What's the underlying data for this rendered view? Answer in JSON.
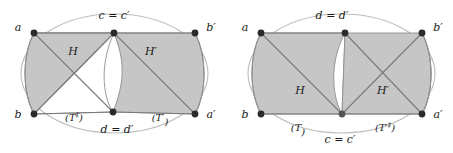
{
  "figure": {
    "type": "diagram",
    "colors": {
      "shade_fill": "#c6c6c6",
      "shade_stroke": "#8a8a8a",
      "ellipse_stroke": "#b9b9b9",
      "edge_stroke": "#7a7a7a",
      "vertex_fill": "#2b2b2b",
      "text": "#1a1a1a",
      "background": "#ffffff"
    },
    "panels": [
      {
        "id": "left",
        "name": "left-diagram",
        "vertices": [
          {
            "id": "a",
            "label": "a",
            "label_pos": "left",
            "x": 34,
            "y": 33
          },
          {
            "id": "b",
            "label": "b",
            "label_pos": "left",
            "x": 34,
            "y": 114
          },
          {
            "id": "c",
            "label": "c = c′",
            "label_pos": "top",
            "x": 114,
            "y": 33
          },
          {
            "id": "d",
            "label": "d = d′",
            "label_pos": "bottom",
            "x": 113,
            "y": 112
          },
          {
            "id": "bp",
            "label": "b′",
            "label_pos": "right",
            "x": 195,
            "y": 33
          },
          {
            "id": "ap",
            "label": "a′",
            "label_pos": "right",
            "x": 195,
            "y": 114
          }
        ],
        "regions": [
          {
            "id": "H",
            "label": "H",
            "x": 73,
            "y": 51
          },
          {
            "id": "Hp",
            "label": "H′",
            "x": 151,
            "y": 51
          }
        ],
        "surface_labels": [
          {
            "id": "T-left",
            "base": "(T",
            "sup": "‡",
            "close": ")",
            "x": 74,
            "y": 118
          },
          {
            "id": "T-right",
            "base": "(T′",
            "sup": "",
            "close": ")",
            "x": 160,
            "y": 118
          }
        ]
      },
      {
        "id": "right",
        "name": "right-diagram",
        "vertices": [
          {
            "id": "a",
            "label": "a",
            "label_pos": "left",
            "x": 261,
            "y": 33
          },
          {
            "id": "b",
            "label": "b",
            "label_pos": "left",
            "x": 261,
            "y": 114
          },
          {
            "id": "d",
            "label": "d = d′",
            "label_pos": "top",
            "x": 345,
            "y": 33
          },
          {
            "id": "c",
            "label": "c = c′",
            "label_pos": "bottom",
            "x": 342,
            "y": 114
          },
          {
            "id": "bp",
            "label": "b′",
            "label_pos": "right",
            "x": 422,
            "y": 33
          },
          {
            "id": "ap",
            "label": "a′",
            "label_pos": "right",
            "x": 422,
            "y": 114
          }
        ],
        "regions": [
          {
            "id": "H",
            "label": "H",
            "x": 300,
            "y": 90
          },
          {
            "id": "Hp",
            "label": "H′",
            "x": 383,
            "y": 90
          }
        ],
        "surface_labels": [
          {
            "id": "T-left",
            "base": "(T",
            "sup": "",
            "close": ")",
            "x": 298,
            "y": 128
          },
          {
            "id": "T-right",
            "base": "(T′",
            "sup": "‡",
            "close": ")",
            "x": 385,
            "y": 128
          }
        ]
      }
    ]
  }
}
